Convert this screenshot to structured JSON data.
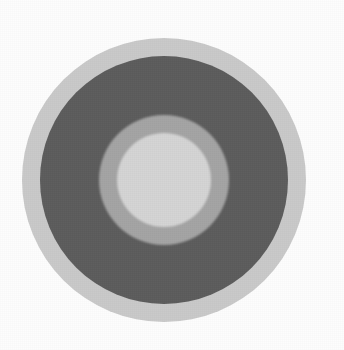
{
  "figure": {
    "canvas": {
      "width": 344,
      "height": 350,
      "background_color": "#fdfdfd"
    },
    "center": {
      "x": 164,
      "y": 180
    },
    "rings": [
      {
        "name": "outer-ring",
        "label": "Outer light grey ring",
        "color": "#c9c9c9",
        "radius": 142,
        "order": 1
      },
      {
        "name": "dark-ring",
        "label": "Dark grey ring",
        "color": "#5c5c5c",
        "radius": 124,
        "order": 2
      },
      {
        "name": "middle-ring",
        "label": "Medium grey ring",
        "color": "#a4a4a4",
        "radius": 65,
        "order": 3
      },
      {
        "name": "inner-disc",
        "label": "Inner light grey disc",
        "color": "#d4d4d4",
        "radius": 47,
        "order": 4
      }
    ]
  },
  "chart_data": {
    "type": "pie",
    "xlabel": "",
    "ylabel": "",
    "legend_position": "none",
    "grid": false,
    "categories": [
      "outer-ring",
      "dark-ring",
      "middle-ring",
      "inner-disc"
    ],
    "values": [
      142,
      124,
      65,
      47
    ],
    "value_units": "radius in pixels",
    "colors": [
      "#c9c9c9",
      "#5c5c5c",
      "#a4a4a4",
      "#d4d4d4"
    ],
    "annotations": []
  }
}
